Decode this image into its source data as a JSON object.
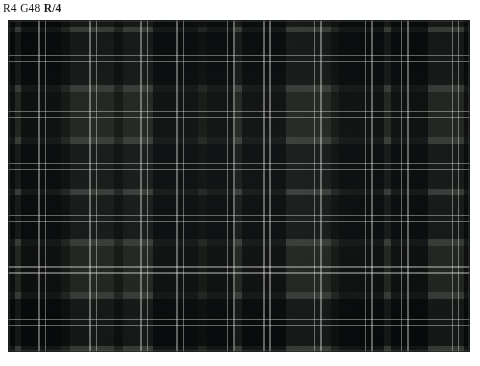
{
  "caption": {
    "full_text": "R4 G48 R/4",
    "segments": [
      {
        "text": "R4",
        "bold": false
      },
      {
        "text": "G48",
        "bold": false
      },
      {
        "text": "R/4",
        "bold": true
      }
    ]
  },
  "swatch": {
    "name": "tartan-plaid-fabric-swatch",
    "alt_text": "Tartan plaid fabric swatch with dark navy-black and grey-green checks",
    "frame": {
      "x": 8,
      "y": 20,
      "width": 462,
      "height": 332
    },
    "colors": {
      "dark": "#23272a",
      "dark_deep": "#1b1f22",
      "mid": "#3c413c",
      "light": "#6a6f68",
      "light_pale": "#767b73",
      "overcheck": "#c9ccc4",
      "ground": "#3f443f"
    },
    "sett": {
      "symmetry": "symmetric",
      "unit_px": 66,
      "thread_count_label": "R4 G48 R/4",
      "warp_stripes": [
        {
          "color_key": "dark",
          "start_pct": 0.0,
          "width_pct": 1.6
        },
        {
          "color_key": "light",
          "start_pct": 1.6,
          "width_pct": 1.2
        },
        {
          "color_key": "dark",
          "start_pct": 2.8,
          "width_pct": 8.6
        },
        {
          "color_key": "mid",
          "start_pct": 11.4,
          "width_pct": 2.0
        },
        {
          "color_key": "light",
          "start_pct": 13.4,
          "width_pct": 9.6
        },
        {
          "color_key": "mid",
          "start_pct": 23.0,
          "width_pct": 2.0
        },
        {
          "color_key": "light",
          "start_pct": 25.0,
          "width_pct": 6.4
        },
        {
          "color_key": "dark",
          "start_pct": 31.4,
          "width_pct": 9.8
        },
        {
          "color_key": "mid",
          "start_pct": 41.2,
          "width_pct": 1.8
        },
        {
          "color_key": "dark",
          "start_pct": 43.0,
          "width_pct": 6.2
        },
        {
          "color_key": "light",
          "start_pct": 49.2,
          "width_pct": 1.4
        },
        {
          "color_key": "dark",
          "start_pct": 50.6,
          "width_pct": 9.6
        },
        {
          "color_key": "light",
          "start_pct": 60.2,
          "width_pct": 9.8
        },
        {
          "color_key": "mid",
          "start_pct": 70.0,
          "width_pct": 1.6
        },
        {
          "color_key": "dark",
          "start_pct": 71.6,
          "width_pct": 9.8
        },
        {
          "color_key": "light",
          "start_pct": 81.4,
          "width_pct": 1.4
        },
        {
          "color_key": "dark",
          "start_pct": 82.8,
          "width_pct": 8.2
        },
        {
          "color_key": "light",
          "start_pct": 91.0,
          "width_pct": 7.6
        },
        {
          "color_key": "dark",
          "start_pct": 98.6,
          "width_pct": 1.4
        }
      ],
      "weft_stripes": [
        {
          "color_key": "dark",
          "start_pct": 0.0,
          "width_pct": 2.0
        },
        {
          "color_key": "light",
          "start_pct": 2.0,
          "width_pct": 1.6
        },
        {
          "color_key": "dark",
          "start_pct": 3.6,
          "width_pct": 16.0
        },
        {
          "color_key": "light",
          "start_pct": 19.6,
          "width_pct": 2.2
        },
        {
          "color_key": "mid",
          "start_pct": 21.8,
          "width_pct": 13.4
        },
        {
          "color_key": "light",
          "start_pct": 35.2,
          "width_pct": 2.0
        },
        {
          "color_key": "dark",
          "start_pct": 37.2,
          "width_pct": 13.6
        },
        {
          "color_key": "light",
          "start_pct": 50.8,
          "width_pct": 2.0
        },
        {
          "color_key": "dark",
          "start_pct": 52.8,
          "width_pct": 13.2
        },
        {
          "color_key": "light",
          "start_pct": 66.0,
          "width_pct": 2.2
        },
        {
          "color_key": "mid",
          "start_pct": 68.2,
          "width_pct": 13.8
        },
        {
          "color_key": "light",
          "start_pct": 82.0,
          "width_pct": 2.0
        },
        {
          "color_key": "dark",
          "start_pct": 84.0,
          "width_pct": 14.2
        },
        {
          "color_key": "light",
          "start_pct": 98.2,
          "width_pct": 1.8
        }
      ],
      "overcheck_v_pct": [
        6.6,
        8.0,
        17.6,
        19.0,
        28.6,
        30.0,
        36.4,
        37.8,
        47.4,
        48.8,
        55.2,
        56.6,
        66.2,
        67.6,
        77.2,
        78.6,
        85.0,
        86.4,
        96.0,
        97.4
      ],
      "overcheck_h_pct": [
        10.4,
        12.2,
        27.4,
        29.2,
        43.0,
        44.8,
        58.6,
        60.4,
        74.2,
        76.0,
        90.0,
        91.8
      ]
    }
  }
}
